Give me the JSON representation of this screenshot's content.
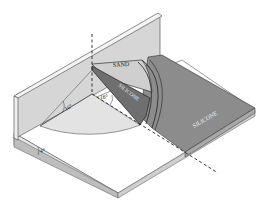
{
  "diagram": {
    "type": "isometric experimental apparatus",
    "labels": {
      "sand": "SAND",
      "silicone_wedge": "SILICONE",
      "silicone_sheet": "SILICONE",
      "angle_left": "16°",
      "angle_center": "16°",
      "angle_base": "4°"
    },
    "colors": {
      "background": "#ffffff",
      "wall_face": "#d6d6d6",
      "wall_top": "#f4f4f4",
      "sector_fill": "#e3e3e3",
      "sand_fill": "#cfcfcf",
      "silicone_dark": "#7a7a7a",
      "silicone_sheet": "#8c8c8c",
      "base_edge": "#bdbdbd",
      "line": "#333333"
    }
  }
}
